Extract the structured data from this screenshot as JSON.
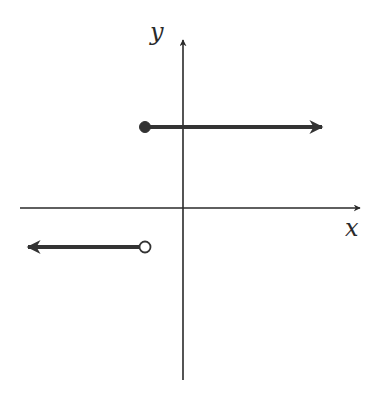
{
  "diagram": {
    "type": "piecewise-step-function-graph",
    "axes": {
      "x_label": "x",
      "y_label": "y",
      "origin_px": [
        183,
        208
      ],
      "x_axis": {
        "start_px": 20,
        "end_px": 360,
        "y_px": 208
      },
      "y_axis": {
        "start_px": 380,
        "end_px": 40,
        "x_px": 183
      }
    },
    "pieces": [
      {
        "name": "upper-ray",
        "direction": "right",
        "endpoint": "closed",
        "start_px": [
          145,
          127
        ],
        "end_px": [
          322,
          127
        ]
      },
      {
        "name": "lower-ray",
        "direction": "left",
        "endpoint": "open",
        "start_px": [
          145,
          247
        ],
        "end_px": [
          25,
          247
        ]
      }
    ],
    "colors": {
      "axis": "#2a2a2a",
      "ray": "#333333",
      "background": "#ffffff"
    }
  }
}
